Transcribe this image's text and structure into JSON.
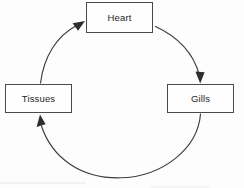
{
  "diagram": {
    "background_color": "#fdfdfd",
    "stroke_color": "#3c3c3c",
    "box_border_color": "#4a4a4a",
    "text_color": "#1d1d1d",
    "flow_direction": "clockwise",
    "nodes": [
      {
        "id": "heart",
        "label": "Heart",
        "position": "top"
      },
      {
        "id": "gills",
        "label": "Gills",
        "position": "right"
      },
      {
        "id": "tissues",
        "label": "Tissues",
        "position": "left"
      }
    ],
    "edges": [
      {
        "id": "heart-to-gills",
        "from": "Heart",
        "to": "Gills",
        "arrow": "down",
        "shape": "arc"
      },
      {
        "id": "gills-to-bottom",
        "from": "Gills",
        "to": "Tissues",
        "arrow": "none",
        "shape": "arc"
      },
      {
        "id": "bottom-to-tissues",
        "from": "Gills",
        "to": "Tissues",
        "arrow": "up",
        "shape": "arc"
      },
      {
        "id": "tissues-to-heart",
        "from": "Tissues",
        "to": "Heart",
        "arrow": "up-right",
        "shape": "arc"
      }
    ],
    "circle": {
      "center_x": 120,
      "center_y": 98,
      "radius": 80
    }
  }
}
